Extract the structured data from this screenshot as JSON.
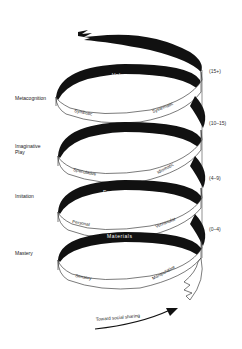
{
  "diagram": {
    "type": "spiral",
    "levels": [
      {
        "stage": "Metacognition",
        "band_label": "Value",
        "left_label": "Symbolic",
        "right_label": "Systematic",
        "age": "(15+)"
      },
      {
        "stage": "Imaginative Play",
        "stage_lines": [
          "Imaginative",
          "Play"
        ],
        "band_label": "Form",
        "left_label": "Speculative",
        "right_label": "Idiomatic",
        "age": "(10–15)"
      },
      {
        "stage": "Imitation",
        "band_label": "Expression",
        "left_label": "Personal",
        "right_label": "Vernacular",
        "age": "(4–9)"
      },
      {
        "stage": "Mastery",
        "band_label": "Materials",
        "left_label": "Sensory",
        "right_label": "Manipulative",
        "age": "(0–4)"
      }
    ],
    "arrow_label": "Toward social sharing",
    "colors": {
      "band_dark": "#111111",
      "band_light": "#ffffff",
      "outline": "#222222",
      "text": "#222222"
    }
  }
}
